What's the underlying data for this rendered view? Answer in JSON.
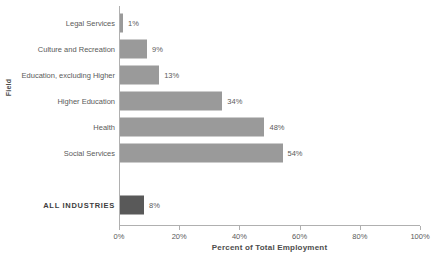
{
  "chart_data": {
    "type": "bar",
    "orientation": "horizontal",
    "title": "",
    "xlabel": "Percent of Total Employment",
    "ylabel": "Field",
    "xlim": [
      0,
      100
    ],
    "xticks": [
      "0%",
      "20%",
      "40%",
      "60%",
      "80%",
      "100%"
    ],
    "xtick_values": [
      0,
      20,
      40,
      60,
      80,
      100
    ],
    "grid": false,
    "legend": null,
    "categories": [
      "Legal Services",
      "Culture  and Recreation",
      "Education, excluding Higher",
      "Higher Education",
      "Health",
      "Social Services",
      "",
      "ALL  INDUSTRIES"
    ],
    "values": [
      1,
      9,
      13,
      34,
      48,
      54,
      null,
      8
    ],
    "value_labels": [
      "1%",
      "9%",
      "13%",
      "34%",
      "48%",
      "54%",
      "",
      "8%"
    ],
    "bars": [
      {
        "category": "Legal Services",
        "value": 1,
        "label": "1%",
        "color": "#9a9a9a",
        "emphasis": false,
        "spacer": false
      },
      {
        "category": "Culture  and Recreation",
        "value": 9,
        "label": "9%",
        "color": "#9a9a9a",
        "emphasis": false,
        "spacer": false
      },
      {
        "category": "Education, excluding Higher",
        "value": 13,
        "label": "13%",
        "color": "#9a9a9a",
        "emphasis": false,
        "spacer": false
      },
      {
        "category": "Higher Education",
        "value": 34,
        "label": "34%",
        "color": "#9a9a9a",
        "emphasis": false,
        "spacer": false
      },
      {
        "category": "Health",
        "value": 48,
        "label": "48%",
        "color": "#9a9a9a",
        "emphasis": false,
        "spacer": false
      },
      {
        "category": "Social Services",
        "value": 54,
        "label": "54%",
        "color": "#9a9a9a",
        "emphasis": false,
        "spacer": false
      },
      {
        "category": "",
        "value": 0,
        "label": "",
        "color": "#9a9a9a",
        "emphasis": false,
        "spacer": true
      },
      {
        "category": "ALL  INDUSTRIES",
        "value": 8,
        "label": "8%",
        "color": "#595959",
        "emphasis": true,
        "spacer": false
      }
    ],
    "colors": {
      "bar": "#9a9a9a",
      "bar_highlight": "#595959",
      "axis": "#b0b0b0",
      "text": "#5a5a5a",
      "background": "#ffffff"
    }
  }
}
